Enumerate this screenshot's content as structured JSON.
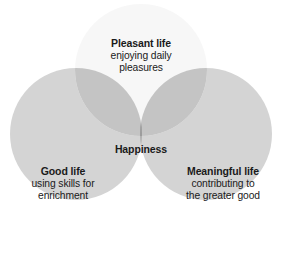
{
  "diagram": {
    "type": "venn",
    "title_text": "",
    "background_color": "#ffffff",
    "text_color": "#1a1a1a",
    "sets": [
      {
        "id": "pleasant-life",
        "title": "Pleasant life",
        "description_line1": "enjoying daily",
        "description_line2": "pleasures",
        "fill_color": "#f7f7f7",
        "position": "top",
        "center_x": 141,
        "center_y": 70,
        "radius": 66
      },
      {
        "id": "good-life",
        "title": "Good life",
        "description_line1": "using skills for",
        "description_line2": "enrichment",
        "fill_color": "#d4d4d4",
        "position": "bottom-left",
        "center_x": 76,
        "center_y": 134,
        "radius": 66
      },
      {
        "id": "meaningful-life",
        "title": "Meaningful life",
        "description_line1": "contributing to",
        "description_line2": "the greater good",
        "fill_color": "#d4d4d4",
        "position": "bottom-right",
        "center_x": 206,
        "center_y": 134,
        "radius": 66
      }
    ],
    "intersection": {
      "id": "happiness",
      "label": "Happiness",
      "fill_color": "#9c9c9c"
    },
    "pair_overlap_colors": {
      "top_with_left": "#c4c4c4",
      "top_with_right": "#c4c4c4",
      "left_with_right": "#acacac"
    }
  }
}
